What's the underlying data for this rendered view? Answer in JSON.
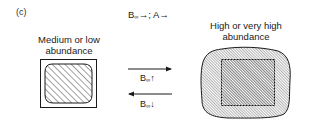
{
  "panel": {
    "label": "(c)"
  },
  "header": {
    "text_main": "B",
    "text_sub": "∞",
    "text_rest": "→; A→"
  },
  "left_state": {
    "label_line1": "Medium or low",
    "label_line2": "abundance"
  },
  "right_state": {
    "label_line1": "High or very high",
    "label_line2": "abundance"
  },
  "transitions": {
    "forward": {
      "arrow": "→",
      "main": "B",
      "sub": "∞",
      "dir": "↑"
    },
    "backward": {
      "arrow": "←",
      "main": "B",
      "sub": "∞",
      "dir": "↓"
    }
  },
  "colors": {
    "ink": "#1a1a1a",
    "hatch": "#333333",
    "background": "#ffffff"
  }
}
